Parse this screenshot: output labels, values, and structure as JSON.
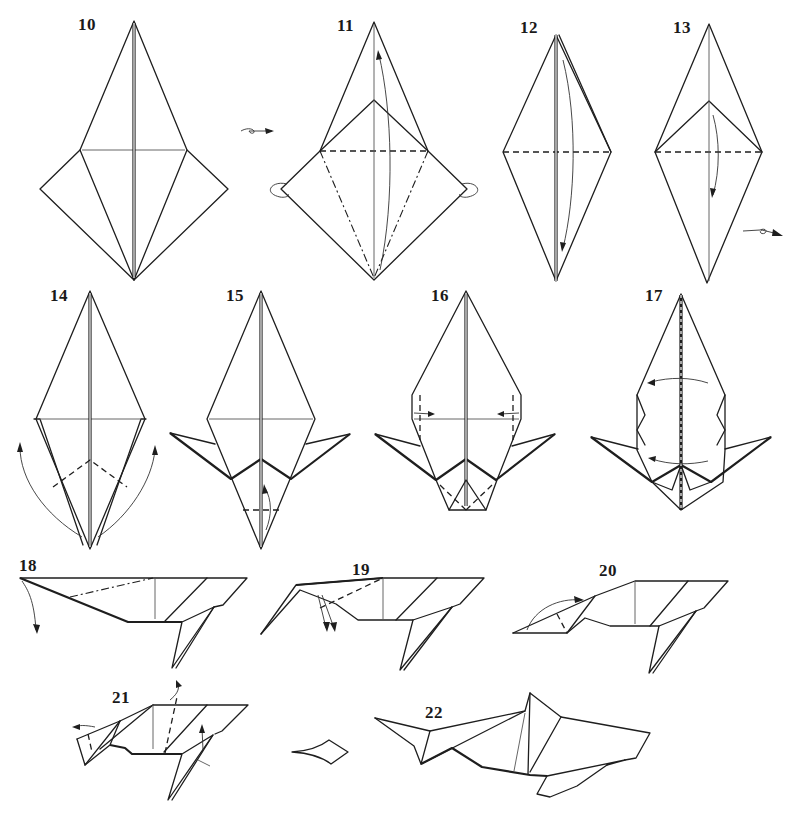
{
  "diagram": {
    "colors": {
      "line": "#1e1e1e",
      "background": "#ffffff",
      "crease": "#555555"
    },
    "steps": [
      {
        "number": "10",
        "label_pos": [
          78,
          16
        ],
        "action": "turn-over"
      },
      {
        "number": "11",
        "label_pos": [
          337,
          17
        ],
        "action": "petal-fold"
      },
      {
        "number": "12",
        "label_pos": [
          520,
          19
        ],
        "action": "fold-down"
      },
      {
        "number": "13",
        "label_pos": [
          673,
          19
        ],
        "action": "turn-over"
      },
      {
        "number": "14",
        "label_pos": [
          50,
          287
        ],
        "action": "reverse-fold-legs"
      },
      {
        "number": "15",
        "label_pos": [
          226,
          287
        ],
        "action": "fold-tip-up"
      },
      {
        "number": "16",
        "label_pos": [
          431,
          287
        ],
        "action": "squash-sides"
      },
      {
        "number": "17",
        "label_pos": [
          645,
          287
        ],
        "action": "fold-in-half"
      },
      {
        "number": "18",
        "label_pos": [
          19,
          557
        ],
        "action": "reverse-fold-head"
      },
      {
        "number": "19",
        "label_pos": [
          352,
          561
        ],
        "action": "reverse-fold"
      },
      {
        "number": "20",
        "label_pos": [
          599,
          562
        ],
        "action": "reverse-fold-tail"
      },
      {
        "number": "21",
        "label_pos": [
          112,
          689
        ],
        "action": "crimp-and-shape"
      },
      {
        "number": "22",
        "label_pos": [
          425,
          704
        ],
        "action": "finished"
      }
    ],
    "symbols": {
      "turn_over_1": "turn-over-icon",
      "turn_over_2": "turn-over-icon",
      "result_arrow": "result-arrow-icon"
    }
  }
}
